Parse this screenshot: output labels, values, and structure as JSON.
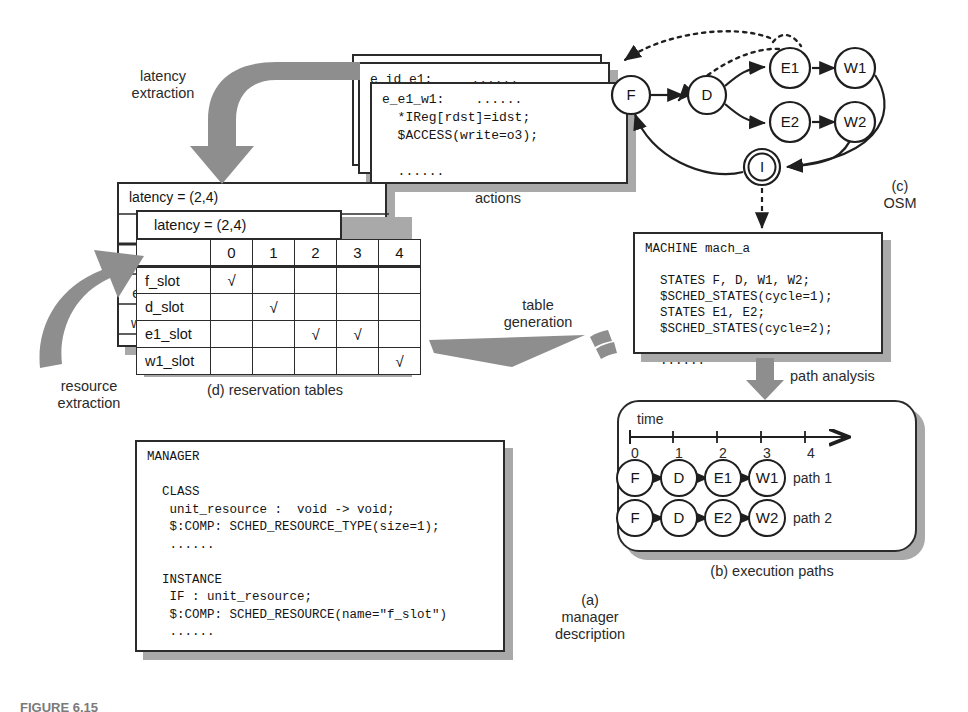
{
  "figure": {
    "caption_prefix": "FIGURE 6.15"
  },
  "process_labels": {
    "latency_extraction": "latency\nextraction",
    "resource_extraction": "resource\nextraction",
    "table_generation": "table\ngeneration",
    "path_analysis": "path analysis"
  },
  "captions": {
    "actions": "actions",
    "osm": "(c)\nOSM",
    "reservation_tables": "(d) reservation tables",
    "execution_paths": "(b) execution paths",
    "manager_description": "(a)\nmanager\ndescription"
  },
  "actions_box": {
    "layers": 3,
    "back_line": "e_id e1:     ......",
    "back_line2": "$",
    "front_lines": [
      "e_e1_w1:    ......",
      "  *IReg[rdst]=idst;",
      "  $ACCESS(write=o3);",
      "",
      "  ......"
    ]
  },
  "osm": {
    "states": [
      {
        "id": "F",
        "label": "F",
        "cx": 631,
        "cy": 95,
        "r": 19,
        "double": false
      },
      {
        "id": "D",
        "label": "D",
        "cx": 707,
        "cy": 95,
        "r": 19,
        "double": false
      },
      {
        "id": "E1",
        "label": "E1",
        "cx": 790,
        "cy": 68,
        "r": 20,
        "double": false
      },
      {
        "id": "E2",
        "label": "E2",
        "cx": 790,
        "cy": 122,
        "r": 20,
        "double": false
      },
      {
        "id": "W1",
        "label": "W1",
        "cx": 855,
        "cy": 68,
        "r": 20,
        "double": false
      },
      {
        "id": "W2",
        "label": "W2",
        "cx": 855,
        "cy": 122,
        "r": 20,
        "double": false
      },
      {
        "id": "I",
        "label": "I",
        "cx": 762,
        "cy": 167,
        "r": 18,
        "double": true
      }
    ],
    "transitions": [
      "F->D",
      "D->E1",
      "D->E2",
      "E1->W1",
      "E2->W2",
      "W1->I",
      "W2->I",
      "I->F"
    ]
  },
  "machine_box": {
    "lines": [
      "MACHINE mach_a",
      "",
      "  STATES F, D, W1, W2;",
      "  $SCHED_STATES(cycle=1);",
      "  STATES E1, E2;",
      "  $SCHED_STATES(cycle=2);",
      "",
      "  ......"
    ]
  },
  "execution_paths": {
    "time_label": "time",
    "ticks": [
      "0",
      "1",
      "2",
      "3",
      "4"
    ],
    "paths": [
      {
        "name": "path 1",
        "nodes": [
          "F",
          "D",
          "E1",
          "W1"
        ]
      },
      {
        "name": "path 2",
        "nodes": [
          "F",
          "D",
          "E2",
          "W2"
        ]
      }
    ]
  },
  "reservation_tables": {
    "stack_count": 3,
    "latency_label": "latency = (2,4)",
    "latency_label_back": "latency = (2,4)",
    "columns": [
      "",
      "0",
      "1",
      "2",
      "3",
      "4"
    ],
    "check_glyph": "√",
    "rows": [
      {
        "slot": "f_slot",
        "checks": [
          true,
          false,
          false,
          false,
          false
        ]
      },
      {
        "slot": "d_slot",
        "checks": [
          false,
          true,
          false,
          false,
          false
        ]
      },
      {
        "slot": "e1_slot",
        "checks": [
          false,
          false,
          true,
          true,
          false
        ]
      },
      {
        "slot": "w1_slot",
        "checks": [
          false,
          false,
          false,
          false,
          true
        ]
      }
    ],
    "back_row_labels": [
      "f",
      "d",
      "e2",
      "w2"
    ],
    "back_col_labels": [
      "2",
      "3",
      "4"
    ]
  },
  "manager_box": {
    "lines": [
      "MANAGER",
      "",
      "  CLASS",
      "   unit_resource :  void -> void;",
      "   $:COMP: SCHED_RESOURCE_TYPE(size=1);",
      "   ......",
      "",
      "  INSTANCE",
      "   IF : unit_resource;",
      "   $:COMP: SCHED_RESOURCE(name=\"f_slot\")",
      "   ......"
    ]
  },
  "colors": {
    "ink": "#2b2b2b",
    "shadow": "#a9a9a9",
    "arrow_gray": "#808080",
    "paper": "#ffffff"
  }
}
